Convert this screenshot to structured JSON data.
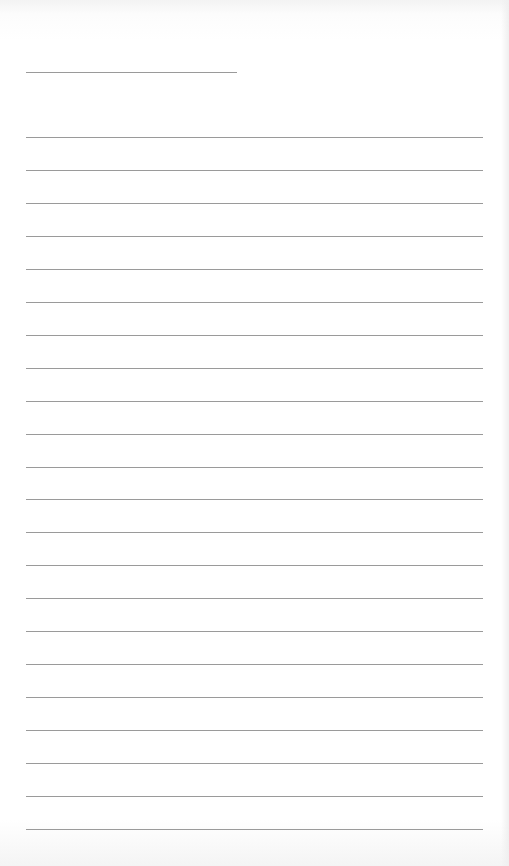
{
  "document": {
    "type": "lined-paper",
    "header_line": {
      "present": true
    },
    "ruled_lines": {
      "count": 22
    },
    "text": ""
  }
}
